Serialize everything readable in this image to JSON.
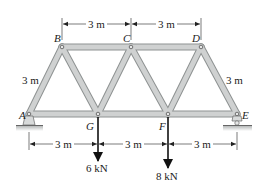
{
  "diagram": {
    "type": "truss",
    "nodes": {
      "A": {
        "label": "A",
        "x": 29,
        "y": 114
      },
      "B": {
        "label": "B",
        "x": 62,
        "y": 47
      },
      "C": {
        "label": "C",
        "x": 131,
        "y": 47
      },
      "D": {
        "label": "D",
        "x": 201,
        "y": 47
      },
      "E": {
        "label": "E",
        "x": 237,
        "y": 114
      },
      "F": {
        "label": "F",
        "x": 168,
        "y": 114
      },
      "G": {
        "label": "G",
        "x": 98,
        "y": 114
      }
    },
    "members": [
      [
        "A",
        "B"
      ],
      [
        "B",
        "C"
      ],
      [
        "C",
        "D"
      ],
      [
        "D",
        "E"
      ],
      [
        "A",
        "G"
      ],
      [
        "G",
        "F"
      ],
      [
        "F",
        "E"
      ],
      [
        "B",
        "G"
      ],
      [
        "G",
        "C"
      ],
      [
        "C",
        "F"
      ],
      [
        "F",
        "D"
      ]
    ],
    "dimensions": {
      "top_bc": "3 m",
      "top_cd": "3 m",
      "left_height": "3 m",
      "right_height": "3 m",
      "bottom_ag": "3 m",
      "bottom_gf": "3 m",
      "bottom_fe": "3 m"
    },
    "loads": [
      {
        "node": "G",
        "label": "6 kN"
      },
      {
        "node": "F",
        "label": "8 kN"
      }
    ],
    "supports": {
      "A": "pin",
      "E": "roller"
    },
    "colors": {
      "member_fill": "#c9cbcb",
      "member_edge": "#8e9292",
      "ink": "#222222",
      "ground": "#b9bcbc"
    }
  }
}
